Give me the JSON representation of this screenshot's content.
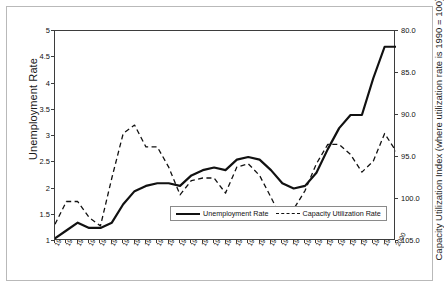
{
  "chart_data": {
    "type": "line",
    "title": "",
    "xlabel": "",
    "ylabel": "Unemployment Rate",
    "ylabel_right": "Capacity Utilization Index (where utilization rate is 1990 = 100)",
    "grid": false,
    "legend_position": "bottom-center",
    "x": [
      1970,
      1971,
      1972,
      1973,
      1974,
      1975,
      1976,
      1977,
      1978,
      1979,
      1980,
      1981,
      1982,
      1983,
      1984,
      1985,
      1986,
      1987,
      1988,
      1989,
      1990,
      1991,
      1992,
      1993,
      1994,
      1995,
      1996,
      1997,
      1998,
      1999,
      2000
    ],
    "categories": [
      "1970",
      "1971",
      "1972",
      "1973",
      "1974",
      "1975",
      "1976",
      "1977",
      "1978",
      "1979",
      "1980",
      "1981",
      "1982",
      "1983",
      "1984",
      "1985",
      "1986",
      "1987",
      "1988",
      "1989",
      "1990",
      "1991",
      "1992",
      "1993",
      "1994",
      "1995",
      "1996",
      "1997",
      "1998",
      "1999",
      "2000"
    ],
    "ylim": [
      1,
      5
    ],
    "yticks": [
      1,
      1.5,
      2,
      2.5,
      3,
      3.5,
      4,
      4.5,
      5
    ],
    "ytick_labels": [
      "1",
      "1.5",
      "2",
      "2.5",
      "3",
      "3.5",
      "4",
      "4.5",
      "5"
    ],
    "ylim_right": [
      105.0,
      80.0
    ],
    "yticks_right": [
      80.0,
      85.0,
      90.0,
      95.0,
      100.0,
      105.0
    ],
    "ytick_labels_right": [
      "80.0",
      "85.0",
      "90.0",
      "95.0",
      "100.0",
      "105.0"
    ],
    "series": [
      {
        "name": "Unemployment Rate",
        "axis": "left",
        "style": "solid",
        "color": "#111111",
        "values": [
          1.05,
          1.2,
          1.35,
          1.25,
          1.25,
          1.35,
          1.7,
          1.95,
          2.05,
          2.1,
          2.1,
          2.05,
          2.25,
          2.35,
          2.4,
          2.35,
          2.55,
          2.6,
          2.55,
          2.35,
          2.1,
          2.0,
          2.05,
          2.3,
          2.75,
          3.15,
          3.4,
          3.4,
          4.1,
          4.7,
          4.7
        ]
      },
      {
        "name": "Capacity Utilization Rate",
        "axis": "right",
        "style": "dashed",
        "color": "#111111",
        "values": [
          103.0,
          100.3,
          100.3,
          102.2,
          103.2,
          97.5,
          92.2,
          91.2,
          93.8,
          93.8,
          96.2,
          99.5,
          97.8,
          97.5,
          97.5,
          99.3,
          96.2,
          95.8,
          97.2,
          99.8,
          102.5,
          101.2,
          99.0,
          95.8,
          93.5,
          93.5,
          94.7,
          96.8,
          95.5,
          92.2,
          94.3
        ]
      }
    ]
  },
  "legend": {
    "entries": [
      {
        "label": "Unemployment Rate",
        "style": "solid"
      },
      {
        "label": "Capacity Utilization Rate",
        "style": "dashed"
      }
    ]
  }
}
